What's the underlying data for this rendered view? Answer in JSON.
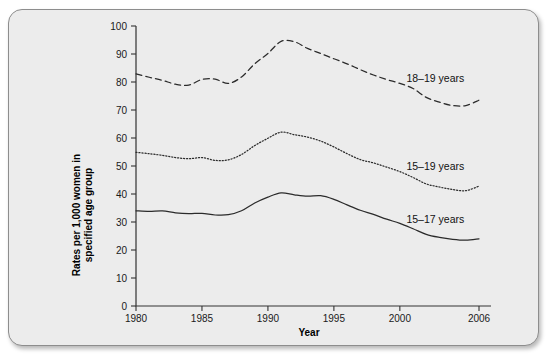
{
  "figure": {
    "background_color": "#ececec",
    "border_color": "#8d8d8d",
    "line_color": "#2b2b2b"
  },
  "chart_data": {
    "type": "line",
    "title": "",
    "xlabel": "Year",
    "ylabel": "Rates per 1,000 women in specified age group",
    "ylabel_line1": "Rates per 1,000 women in",
    "ylabel_line2": "specified age group",
    "xlim": [
      1980,
      2006
    ],
    "ylim": [
      0,
      100
    ],
    "ytick_labels": [
      "100",
      "90",
      "80",
      "70",
      "60",
      "50",
      "40",
      "30",
      "20",
      "10",
      "0"
    ],
    "yticks": [
      100,
      90,
      80,
      70,
      60,
      50,
      40,
      30,
      20,
      10,
      0
    ],
    "xtick_labels": [
      "1980",
      "1985",
      "1990",
      "1995",
      "2000",
      "2006"
    ],
    "xticks": [
      1980,
      1985,
      1990,
      1995,
      2000,
      2006
    ],
    "grid": false,
    "legend_position": "inline-right-of-series",
    "x": [
      1980,
      1981,
      1982,
      1983,
      1984,
      1985,
      1986,
      1987,
      1988,
      1989,
      1990,
      1991,
      1992,
      1993,
      1994,
      1995,
      1996,
      1997,
      1998,
      1999,
      2000,
      2001,
      2002,
      2003,
      2004,
      2005,
      2006
    ],
    "series": [
      {
        "name": "18–19 years",
        "style": "dashed",
        "label": "18–19 years",
        "values": [
          82.9,
          81.7,
          80.6,
          79.2,
          78.9,
          80.9,
          81.0,
          79.5,
          81.8,
          86.5,
          90.2,
          94.5,
          94.4,
          92.0,
          90.2,
          88.3,
          86.5,
          84.4,
          82.5,
          80.9,
          79.5,
          77.7,
          74.5,
          72.8,
          71.6,
          71.6,
          73.5
        ]
      },
      {
        "name": "15–19 years",
        "style": "dotted",
        "label": "15–19 years",
        "values": [
          54.9,
          54.4,
          53.8,
          53.0,
          52.6,
          53.0,
          52.0,
          52.2,
          54.1,
          57.3,
          59.9,
          62.1,
          61.2,
          60.3,
          58.9,
          56.8,
          54.4,
          52.3,
          51.1,
          49.6,
          48.0,
          45.9,
          43.6,
          42.5,
          41.6,
          41.2,
          42.8
        ]
      },
      {
        "name": "15–17 years",
        "style": "solid",
        "label": "15–17 years",
        "values": [
          34.0,
          33.8,
          34.0,
          33.3,
          33.0,
          33.1,
          32.5,
          32.6,
          34.0,
          36.8,
          38.9,
          40.4,
          39.7,
          39.2,
          39.4,
          38.1,
          36.1,
          34.2,
          32.7,
          31.0,
          29.5,
          27.6,
          25.6,
          24.5,
          23.8,
          23.5,
          24.0
        ]
      }
    ],
    "annotations": [
      {
        "text": "18–19 years",
        "x": 2000.5,
        "y": 80.0
      },
      {
        "text": "15–19 years",
        "x": 2000.5,
        "y": 48.5
      },
      {
        "text": "15–17 years",
        "x": 2000.5,
        "y": 29.5
      }
    ]
  }
}
